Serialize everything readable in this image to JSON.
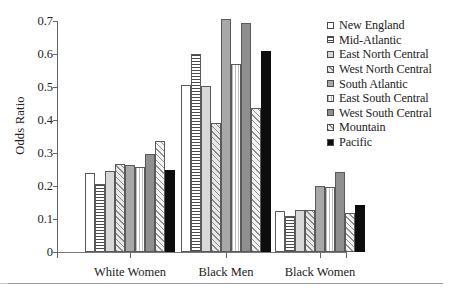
{
  "chart_data": {
    "type": "bar",
    "title": "",
    "xlabel": "",
    "ylabel": "Odds Ratio",
    "ylim": [
      0,
      0.7
    ],
    "yticks": [
      "0",
      "0.1",
      "0.2",
      "0.3",
      "0.4",
      "0.5",
      "0.6",
      "0.7"
    ],
    "ytick_values": [
      0,
      0.1,
      0.2,
      0.3,
      0.4,
      0.5,
      0.6,
      0.7
    ],
    "grid": false,
    "legend_position": "right",
    "categories": [
      "White Women",
      "Black Men",
      "Black Women"
    ],
    "series": [
      {
        "name": "New England",
        "pattern": "blank",
        "values": [
          0.238,
          0.506,
          0.124
        ]
      },
      {
        "name": "Mid-Atlantic",
        "pattern": "hline",
        "values": [
          0.207,
          0.6,
          0.108
        ]
      },
      {
        "name": "East North Central",
        "pattern": "lgray",
        "values": [
          0.245,
          0.503,
          0.127
        ]
      },
      {
        "name": "West North Central",
        "pattern": "hatch",
        "values": [
          0.266,
          0.392,
          0.126
        ]
      },
      {
        "name": "South Atlantic",
        "pattern": "mgray",
        "values": [
          0.265,
          0.705,
          0.201
        ]
      },
      {
        "name": "East South Central",
        "pattern": "vline",
        "values": [
          0.259,
          0.569,
          0.197
        ]
      },
      {
        "name": "West South Central",
        "pattern": "dgray",
        "values": [
          0.298,
          0.694,
          0.243
        ]
      },
      {
        "name": "Mountain",
        "pattern": "hatch2",
        "values": [
          0.336,
          0.437,
          0.117
        ]
      },
      {
        "name": "Pacific",
        "pattern": "black",
        "values": [
          0.248,
          0.609,
          0.143
        ]
      }
    ]
  }
}
